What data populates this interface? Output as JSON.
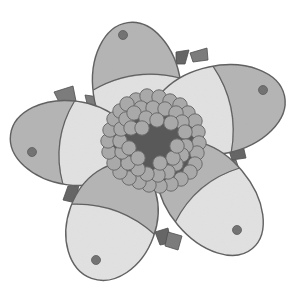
{
  "illustration": {
    "subject": "stylized flower",
    "style": "grayscale pencil illustration",
    "width": 294,
    "height": 294
  },
  "colors": {
    "background": "#ffffff",
    "petal_fill": "#e2e2e2",
    "petal_tip": "#b4b4b4",
    "outline": "#5a5a5a",
    "dot": "#6e6e6e",
    "sepal": "#7c7c7c",
    "sepal_dark": "#666666",
    "center_dark": "#595959",
    "stamen_fill": "#a9a9a9",
    "stamen_stroke": "#6b6b6b"
  },
  "petals": [
    {
      "name": "top",
      "cx": 137,
      "cy": 88,
      "rx": 44,
      "ry": 66,
      "rot": -8,
      "tip": "top",
      "dot": [
        123,
        35
      ]
    },
    {
      "name": "right",
      "cx": 218,
      "cy": 110,
      "rx": 44,
      "ry": 68,
      "rot": 78,
      "tip": "right",
      "dot": [
        263,
        90
      ]
    },
    {
      "name": "left",
      "cx": 72,
      "cy": 143,
      "rx": 42,
      "ry": 62,
      "rot": -82,
      "tip": "left",
      "dot": [
        32,
        152
      ]
    },
    {
      "name": "bottom-left",
      "cx": 112,
      "cy": 222,
      "rx": 44,
      "ry": 60,
      "rot": 20,
      "tip": "bottom",
      "dot": [
        96,
        260
      ]
    },
    {
      "name": "bottom-right",
      "cx": 210,
      "cy": 198,
      "rx": 42,
      "ry": 66,
      "rot": -40,
      "tip": "bottom",
      "dot": [
        237,
        230
      ]
    }
  ],
  "sepals": [
    {
      "points": "54,92 73,86 76,101 60,104",
      "shade": "sepal"
    },
    {
      "points": "85,95 99,97 98,110 89,112",
      "shade": "sepal"
    },
    {
      "points": "176,52 189,50 185,64 176,64",
      "shade": "sepal_dark"
    },
    {
      "points": "190,53 207,48 208,60 193,62",
      "shade": "sepal"
    },
    {
      "points": "228,148 243,145 246,158 232,160",
      "shade": "sepal_dark"
    },
    {
      "points": "222,160 236,160 240,172 225,170",
      "shade": "sepal"
    },
    {
      "points": "68,186 79,184 76,203 63,200",
      "shade": "sepal_dark"
    },
    {
      "points": "82,186 96,185 98,196 84,197",
      "shade": "sepal"
    },
    {
      "points": "155,232 168,228 171,243 160,245",
      "shade": "sepal_dark"
    },
    {
      "points": "168,232 182,236 178,250 165,246",
      "shade": "sepal"
    }
  ],
  "center": {
    "dark_cx": 153,
    "dark_cy": 140,
    "dark_r": 30,
    "stamen_r": 7.2,
    "stamens": [
      [
        136,
        100
      ],
      [
        147,
        96
      ],
      [
        159,
        97
      ],
      [
        170,
        101
      ],
      [
        180,
        105
      ],
      [
        188,
        113
      ],
      [
        195,
        121
      ],
      [
        198,
        132
      ],
      [
        199,
        143
      ],
      [
        197,
        153
      ],
      [
        195,
        164
      ],
      [
        190,
        172
      ],
      [
        181,
        179
      ],
      [
        171,
        184
      ],
      [
        160,
        186
      ],
      [
        149,
        185
      ],
      [
        139,
        182
      ],
      [
        129,
        178
      ],
      [
        120,
        172
      ],
      [
        114,
        163
      ],
      [
        109,
        152
      ],
      [
        108,
        141
      ],
      [
        110,
        130
      ],
      [
        114,
        119
      ],
      [
        120,
        111
      ],
      [
        127,
        104
      ],
      [
        141,
        108
      ],
      [
        153,
        108
      ],
      [
        165,
        109
      ],
      [
        176,
        113
      ],
      [
        182,
        122
      ],
      [
        185,
        132
      ],
      [
        186,
        146
      ],
      [
        182,
        155
      ],
      [
        176,
        164
      ],
      [
        168,
        172
      ],
      [
        158,
        175
      ],
      [
        147,
        174
      ],
      [
        138,
        169
      ],
      [
        128,
        163
      ],
      [
        122,
        152
      ],
      [
        120,
        141
      ],
      [
        121,
        129
      ],
      [
        126,
        119
      ],
      [
        134,
        113
      ],
      [
        146,
        118
      ],
      [
        157,
        120
      ],
      [
        171,
        123
      ],
      [
        131,
        128
      ],
      [
        129,
        148
      ],
      [
        138,
        158
      ],
      [
        173,
        158
      ],
      [
        177,
        146
      ],
      [
        142,
        128
      ],
      [
        160,
        163
      ]
    ]
  }
}
